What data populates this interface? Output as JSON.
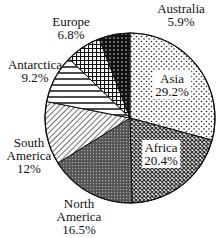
{
  "chart_data": {
    "type": "pie",
    "title": "",
    "categories": [
      "Asia",
      "Africa",
      "North America",
      "South America",
      "Antarctica",
      "Europe",
      "Australia"
    ],
    "values": [
      29.2,
      20.4,
      16.5,
      12,
      9.2,
      6.8,
      5.9
    ],
    "value_labels": [
      "29.2%",
      "20.4%",
      "16.5%",
      "12%",
      "9.2%",
      "6.8%",
      "5.9%"
    ],
    "units": "%",
    "start_angle_deg": 0,
    "direction": "clockwise",
    "fill_patterns": [
      "sparse-dots",
      "dense-diamonds",
      "dark-crosshatch",
      "diagonal-lines",
      "horizontal-lines",
      "grid",
      "dense-dark-dots"
    ],
    "legend": "none (labels placed on/near slices)"
  },
  "labels": {
    "asia": {
      "name": "Asia",
      "pct": "29.2%"
    },
    "africa": {
      "name": "Africa",
      "pct": "20.4%"
    },
    "north_america": {
      "line1": "North",
      "line2": "America",
      "pct": "16.5%"
    },
    "south_america": {
      "line1": "South",
      "line2": "America",
      "pct": "12%"
    },
    "antarctica": {
      "name": "Antarctica",
      "pct": "9.2%"
    },
    "europe": {
      "name": "Europe",
      "pct": "6.8%"
    },
    "australia": {
      "name": "Australia",
      "pct": "5.9%"
    }
  }
}
